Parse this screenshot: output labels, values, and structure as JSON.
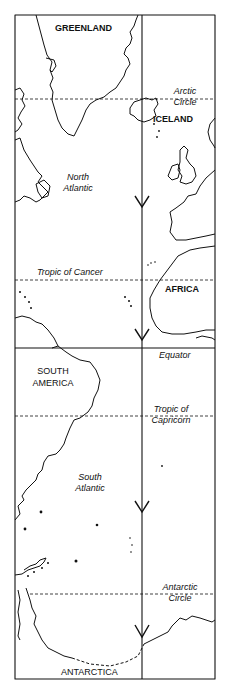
{
  "map": {
    "landmasses": [
      "GREENLAND",
      "ICELAND",
      "AFRICA",
      "SOUTH AMERICA",
      "ANTARCTICA"
    ],
    "oceans": {
      "north": [
        "North",
        "Atlantic"
      ],
      "south": [
        "South",
        "Atlantic"
      ]
    },
    "latitude_lines": {
      "arctic_circle": [
        "Arctic",
        "Circle"
      ],
      "tropic_of_cancer": "Tropic of Cancer",
      "equator": "Equator",
      "tropic_of_capricorn": [
        "Tropic of",
        "Capricorn"
      ],
      "antarctic_circle": [
        "Antarctic",
        "Circle"
      ]
    },
    "route": "Meridian arrow running north to south from Greenland/Iceland to Antarctica",
    "colors": {
      "ink": "#111111",
      "background": "#ffffff"
    }
  }
}
